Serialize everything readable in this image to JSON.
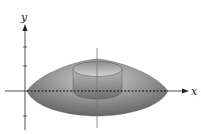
{
  "diagram": {
    "type": "solid-of-revolution",
    "axes": {
      "x_label": "x",
      "y_label": "y"
    },
    "colors": {
      "solid_dark": "#6e6e6e",
      "solid_light": "#c8c8c8",
      "cylinder": "#9a9a9a",
      "axis": "#222222"
    }
  }
}
